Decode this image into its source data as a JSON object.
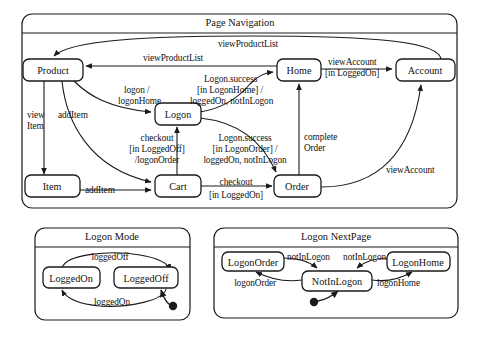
{
  "diagram": {
    "type": "uml-statechart",
    "panels": [
      {
        "id": "page-navigation",
        "title": "Page Navigation",
        "states": [
          "Product",
          "Home",
          "Account",
          "Logon",
          "Item",
          "Cart",
          "Order"
        ]
      },
      {
        "id": "logon-mode",
        "title": "Logon Mode",
        "states": [
          "LoggedOn",
          "LoggedOff"
        ]
      },
      {
        "id": "logon-nextpage",
        "title": "Logon NextPage",
        "states": [
          "LogonOrder",
          "NotInLogon",
          "LogonHome"
        ]
      }
    ]
  },
  "page_navigation": {
    "title": "Page Navigation",
    "states": {
      "product": "Product",
      "home": "Home",
      "account": "Account",
      "logon": "Logon",
      "item": "Item",
      "cart": "Cart",
      "order": "Order"
    },
    "transitions": {
      "account_to_product": "viewProductList",
      "home_to_product": "viewProductList",
      "home_to_account_l1": "viewAccount",
      "home_to_account_l2": "[in LoggedOn]",
      "product_to_logon_l1": "logon /",
      "product_to_logon_l2": "logonHome",
      "logon_to_home_l1": "Logon.success",
      "logon_to_home_l2": "[in LogonHome] /",
      "logon_to_home_l3": "loggedOn, notInLogon",
      "product_to_item_l1": "view",
      "product_to_item_l2": "Item",
      "product_to_cart": "addItem",
      "item_to_cart": "addItem",
      "cart_to_logon_l1": "checkout",
      "cart_to_logon_l2": "[in LoggedOff]",
      "cart_to_logon_l3": "/logonOrder",
      "logon_to_order_l1": "Logon.success",
      "logon_to_order_l2": "[in LogonOrder] /",
      "logon_to_order_l3": "loggedOn, notInLogon",
      "cart_to_order_l1": "checkout",
      "cart_to_order_l2": "[in LoggedOn]",
      "order_to_home_l1": "complete",
      "order_to_home_l2": "Order",
      "order_to_account": "viewAccount"
    }
  },
  "logon_mode": {
    "title": "Logon Mode",
    "states": {
      "logged_on": "LoggedOn",
      "logged_off": "LoggedOff"
    },
    "transitions": {
      "on_to_off": "loggedOff",
      "off_to_on": "loggedOn"
    },
    "has_initial_state": true
  },
  "logon_nextpage": {
    "title": "Logon NextPage",
    "states": {
      "logon_order": "LogonOrder",
      "not_in_logon": "NotInLogon",
      "logon_home": "LogonHome"
    },
    "transitions": {
      "order_to_notin": "notInLogon",
      "home_to_notin": "notInLogon",
      "notin_to_order": "logonOrder",
      "notin_to_home": "logonHome"
    },
    "has_initial_state": true
  },
  "colors": {
    "stroke": "#1a1a1a",
    "background": "#ffffff",
    "text": "#111111"
  }
}
